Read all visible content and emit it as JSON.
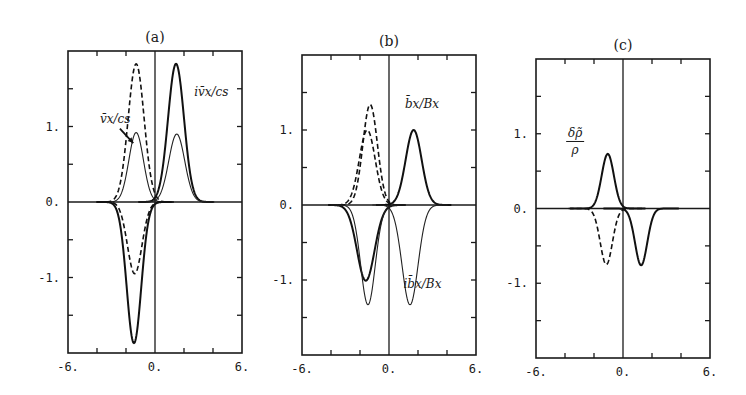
{
  "chart_data": [
    {
      "type": "line",
      "panel": "a",
      "title": "(a)",
      "xlabel": "",
      "ylabel": "",
      "xlim": [
        -6,
        6
      ],
      "ylim": [
        -2,
        2
      ],
      "xticks": [
        -6,
        0,
        6
      ],
      "xtick_labels": [
        "-6.",
        "0.",
        "6."
      ],
      "yticks": [
        -1,
        0,
        1
      ],
      "ytick_labels": [
        "-1.",
        "0.",
        "1."
      ],
      "grid": false,
      "annotations": [
        {
          "text": "v̄x/cs",
          "x": -3.8,
          "y": 1.05,
          "arrow_to": [
            -1.5,
            0.78
          ]
        },
        {
          "text": "iv̄x/cs",
          "x": 2.7,
          "y": 1.4
        }
      ],
      "series": [
        {
          "name": "v̄x/cs (dashed, x<0)",
          "style": "dashed",
          "peaks": [
            {
              "center": -1.3,
              "amp": 1.83,
              "width": 0.55
            }
          ]
        },
        {
          "name": "v̄x/cs (thin, x<0)",
          "style": "thin",
          "peaks": [
            {
              "center": -1.3,
              "amp": 0.92,
              "width": 0.5
            }
          ]
        },
        {
          "name": "iv̄x/cs (bold, x>0)",
          "style": "bold",
          "peaks": [
            {
              "center": 1.45,
              "amp": 1.83,
              "width": 0.55
            }
          ]
        },
        {
          "name": "iv̄x/cs (thin, x>0)",
          "style": "thin",
          "peaks": [
            {
              "center": 1.5,
              "amp": 0.9,
              "width": 0.55
            }
          ]
        },
        {
          "name": "lower dashed",
          "style": "dashed",
          "peaks": [
            {
              "center": -1.4,
              "amp": -0.95,
              "width": 0.5
            }
          ]
        },
        {
          "name": "lower bold",
          "style": "bold",
          "peaks": [
            {
              "center": -1.45,
              "amp": -1.87,
              "width": 0.5
            }
          ]
        }
      ]
    },
    {
      "type": "line",
      "panel": "b",
      "title": "(b)",
      "xlabel": "",
      "ylabel": "",
      "xlim": [
        -6,
        6
      ],
      "ylim": [
        -2,
        2
      ],
      "xticks": [
        -6,
        0,
        6
      ],
      "xtick_labels": [
        "-6.",
        "0.",
        "6."
      ],
      "yticks": [
        -1,
        0,
        1
      ],
      "ytick_labels": [
        "-1.",
        "0.",
        "1."
      ],
      "grid": false,
      "annotations": [
        {
          "text": "b̄x/Bx",
          "x": 1.1,
          "y": 1.3
        },
        {
          "text": "ib̄x/Bx",
          "x": 1.0,
          "y": -1.1
        }
      ],
      "series": [
        {
          "name": "dashed tall (x<0)",
          "style": "dashed",
          "peaks": [
            {
              "center": -1.3,
              "amp": 1.34,
              "width": 0.5
            }
          ]
        },
        {
          "name": "dashed short (x<0)",
          "style": "dashed",
          "peaks": [
            {
              "center": -1.5,
              "amp": 1.0,
              "width": 0.55
            }
          ]
        },
        {
          "name": "b̄x/Bx (bold, x>0)",
          "style": "bold",
          "peaks": [
            {
              "center": 1.7,
              "amp": 1.0,
              "width": 0.55
            }
          ]
        },
        {
          "name": "lower bold (x<0)",
          "style": "bold",
          "peaks": [
            {
              "center": -1.6,
              "amp": -1.01,
              "width": 0.6
            }
          ]
        },
        {
          "name": "lower thin (x<0)",
          "style": "thin",
          "peaks": [
            {
              "center": -1.45,
              "amp": -1.33,
              "width": 0.5
            }
          ]
        },
        {
          "name": "ib̄x/Bx (thin, x>0)",
          "style": "thin",
          "peaks": [
            {
              "center": 1.45,
              "amp": -1.33,
              "width": 0.55
            }
          ]
        }
      ]
    },
    {
      "type": "line",
      "panel": "c",
      "title": "(c)",
      "xlabel": "",
      "ylabel": "",
      "xlim": [
        -6,
        6
      ],
      "ylim": [
        -2,
        2
      ],
      "xticks": [
        -6,
        0,
        6
      ],
      "xtick_labels": [
        "-6.",
        "0.",
        "6."
      ],
      "yticks": [
        -1,
        0,
        1
      ],
      "ytick_labels": [
        "-1.",
        "0.",
        "1."
      ],
      "grid": false,
      "annotations": [
        {
          "text_num": "δρ̃",
          "text_den": "ρ",
          "x": -3.3,
          "y": 0.95
        }
      ],
      "series": [
        {
          "name": "δρ̃/ρ (bold, x<0)",
          "style": "bold",
          "peaks": [
            {
              "center": -1.05,
              "amp": 0.73,
              "width": 0.42
            }
          ]
        },
        {
          "name": "dashed (x<0)",
          "style": "dashed",
          "peaks": [
            {
              "center": -1.15,
              "amp": -0.75,
              "width": 0.42
            }
          ]
        },
        {
          "name": "bold (x>0)",
          "style": "bold",
          "peaks": [
            {
              "center": 1.25,
              "amp": -0.76,
              "width": 0.42
            }
          ]
        }
      ]
    }
  ],
  "layout": {
    "panels": [
      {
        "left": 68,
        "right": 242,
        "top": 51,
        "bottom": 353,
        "title_y": 42
      },
      {
        "left": 302,
        "right": 476,
        "top": 55,
        "bottom": 355,
        "title_y": 46
      },
      {
        "left": 536,
        "right": 710,
        "top": 59,
        "bottom": 358,
        "title_y": 50
      }
    ]
  }
}
